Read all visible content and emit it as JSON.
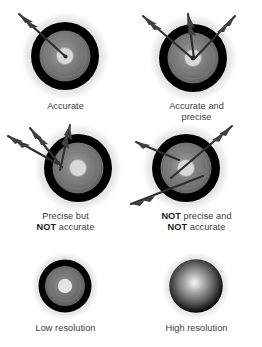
{
  "figure": {
    "background_color": "#ffffff",
    "text_color": "#3a3a3a",
    "bold_text_color": "#1d1d1d"
  },
  "palette": {
    "halo": "#e2e2e2",
    "halo_outer": "#efefef",
    "black_ring": "#000000",
    "gray_ring": "#6e6e6e",
    "inner_gray": "#8a8a8a",
    "center": "#e8e8e8",
    "arrow_shaft": "#2b2b2b",
    "arrow_fletch": "#4a4a4a"
  },
  "targets": [
    {
      "id": "accurate",
      "caption_lines": [
        {
          "text": "Accurate",
          "bold": false
        }
      ],
      "arrow_count": 1,
      "accurate": true,
      "precise": false,
      "resolution": "normal"
    },
    {
      "id": "accurate-and-precise",
      "caption_lines": [
        {
          "text": "Accurate and",
          "bold": false
        },
        {
          "text": "precise",
          "bold": false
        }
      ],
      "arrow_count": 3,
      "accurate": true,
      "precise": true,
      "resolution": "normal"
    },
    {
      "id": "precise-not-accurate",
      "caption_lines": [
        {
          "text": "Precise but",
          "bold": false
        },
        {
          "text": "NOT accurate",
          "bold_prefix": "NOT",
          "rest": " accurate"
        }
      ],
      "arrow_count": 3,
      "accurate": false,
      "precise": true,
      "resolution": "normal"
    },
    {
      "id": "not-precise-not-accurate",
      "caption_lines": [
        {
          "text": "NOT precise and",
          "bold_prefix": "NOT",
          "rest": " precise and"
        },
        {
          "text": "NOT accurate",
          "bold_prefix": "NOT",
          "rest": " accurate"
        }
      ],
      "arrow_count": 3,
      "accurate": false,
      "precise": false,
      "resolution": "normal"
    },
    {
      "id": "low-resolution",
      "caption_lines": [
        {
          "text": "Low resolution",
          "bold": false
        }
      ],
      "arrow_count": 0,
      "resolution": "low"
    },
    {
      "id": "high-resolution",
      "caption_lines": [
        {
          "text": "High resolution",
          "bold": false
        }
      ],
      "arrow_count": 0,
      "resolution": "high"
    }
  ],
  "captions": {
    "accurate": "Accurate",
    "accurate_and_precise_l1": "Accurate and",
    "accurate_and_precise_l2": "precise",
    "precise_not_accurate_l1": "Precise but",
    "precise_not_accurate_l2_bold": "NOT",
    "precise_not_accurate_l2_rest": " accurate",
    "not_precise_not_accurate_l1_bold": "NOT",
    "not_precise_not_accurate_l1_rest": " precise and",
    "not_precise_not_accurate_l2_bold": "NOT",
    "not_precise_not_accurate_l2_rest": " accurate",
    "low_resolution": "Low resolution",
    "high_resolution": "High resolution"
  }
}
